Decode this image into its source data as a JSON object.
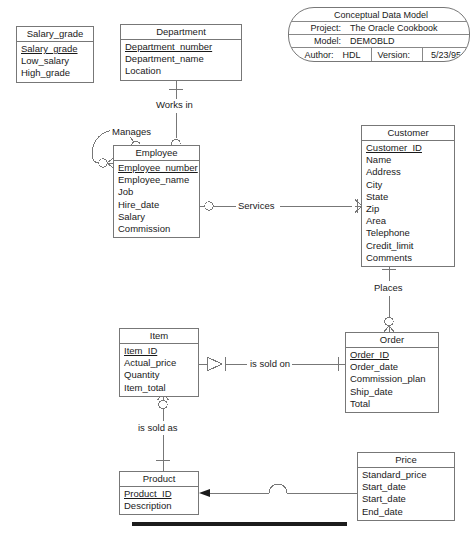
{
  "title_block": {
    "name": "conceptual-data-model-title-block",
    "heading": "Conceptual Data Model",
    "project_label": "Project:",
    "project_value": "The Oracle Cookbook",
    "model_label": "Model:",
    "model_value": "DEMOBLD",
    "author_label": "Author:",
    "author_value": "HDL",
    "version_label": "Version:",
    "version_value": "5/23/95"
  },
  "entities": [
    {
      "id": "salary_grade",
      "title": "Salary_grade",
      "attributes": [
        {
          "text": "Salary_grade",
          "pk": true
        },
        {
          "text": "Low_salary",
          "pk": false
        },
        {
          "text": "High_grade",
          "pk": false
        }
      ]
    },
    {
      "id": "department",
      "title": "Department",
      "attributes": [
        {
          "text": "Department_number",
          "pk": true
        },
        {
          "text": "Department_name",
          "pk": false
        },
        {
          "text": "Location",
          "pk": false
        }
      ]
    },
    {
      "id": "employee",
      "title": "Employee",
      "attributes": [
        {
          "text": "Employee_number",
          "pk": true
        },
        {
          "text": "Employee_name",
          "pk": false
        },
        {
          "text": "Job",
          "pk": false
        },
        {
          "text": "Hire_date",
          "pk": false
        },
        {
          "text": "Salary",
          "pk": false
        },
        {
          "text": "Commission",
          "pk": false
        }
      ]
    },
    {
      "id": "customer",
      "title": "Customer",
      "attributes": [
        {
          "text": "Customer_ID",
          "pk": true
        },
        {
          "text": "Name",
          "pk": false
        },
        {
          "text": "Address",
          "pk": false
        },
        {
          "text": "City",
          "pk": false
        },
        {
          "text": "State",
          "pk": false
        },
        {
          "text": "Zip",
          "pk": false
        },
        {
          "text": "Area",
          "pk": false
        },
        {
          "text": "Telephone",
          "pk": false
        },
        {
          "text": "Credit_limit",
          "pk": false
        },
        {
          "text": "Comments",
          "pk": false
        }
      ]
    },
    {
      "id": "item",
      "title": "Item",
      "attributes": [
        {
          "text": "Item_ID",
          "pk": true
        },
        {
          "text": "Actual_price",
          "pk": false
        },
        {
          "text": "Quantity",
          "pk": false
        },
        {
          "text": "Item_total",
          "pk": false
        }
      ]
    },
    {
      "id": "order",
      "title": "Order",
      "attributes": [
        {
          "text": "Order_ID",
          "pk": true
        },
        {
          "text": "Order_date",
          "pk": false
        },
        {
          "text": "Commission_plan",
          "pk": false
        },
        {
          "text": "Ship_date",
          "pk": false
        },
        {
          "text": "Total",
          "pk": false
        }
      ]
    },
    {
      "id": "product",
      "title": "Product",
      "attributes": [
        {
          "text": "Product_ID",
          "pk": true
        },
        {
          "text": "Description",
          "pk": false
        }
      ]
    },
    {
      "id": "price",
      "title": "Price",
      "attributes": [
        {
          "text": "Standard_price",
          "pk": false
        },
        {
          "text": "Start_date",
          "pk": false
        },
        {
          "text": "Start_date",
          "pk": false
        },
        {
          "text": "End_date",
          "pk": false
        }
      ]
    }
  ],
  "relationships": [
    {
      "id": "works_in",
      "label": "Works in",
      "from": "department",
      "to": "employee"
    },
    {
      "id": "manages",
      "label": "Manages",
      "from": "employee",
      "to": "employee"
    },
    {
      "id": "services",
      "label": "Services",
      "from": "employee",
      "to": "customer"
    },
    {
      "id": "places",
      "label": "Places",
      "from": "customer",
      "to": "order"
    },
    {
      "id": "is_sold_on",
      "label": "is sold on",
      "from": "item",
      "to": "order"
    },
    {
      "id": "is_sold_as",
      "label": "is sold as",
      "from": "item",
      "to": "product"
    },
    {
      "id": "price_link",
      "label": "",
      "from": "price",
      "to": "product"
    }
  ],
  "colors": {
    "line": "#777777",
    "text": "#1a1a1a",
    "background": "#ffffff",
    "rule": "#1c1c1c"
  }
}
